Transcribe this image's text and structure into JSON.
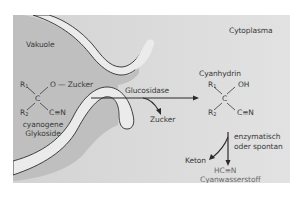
{
  "compartments": {
    "vacuole": "Vakuole",
    "cytoplasm": "Cytoplasma"
  },
  "left_molecule": {
    "r1": "R",
    "r1_sub": "1",
    "r2": "R",
    "r2_sub": "2",
    "center": "C",
    "o_group": "O — Zucker",
    "nitrile": "C≡N",
    "name_line1": "cyanogene",
    "name_line2": "Glykoside"
  },
  "reaction": {
    "enzyme": "Glucosidase",
    "byproduct": "Zucker"
  },
  "right_molecule": {
    "name": "Cyanhydrin",
    "r1": "R",
    "r1_sub": "1",
    "r2": "R",
    "r2_sub": "2",
    "center": "C",
    "oh": "OH",
    "nitrile": "C≡N"
  },
  "decomposition": {
    "condition_line1": "enzymatisch",
    "condition_line2": "oder spontan",
    "byproduct": "Keton",
    "product_formula": "HC≡N",
    "product_name": "Cyanwasserstoff"
  },
  "colors": {
    "vacuole": "#bdbdbd",
    "cytoplasm": "#dcdcdc",
    "membrane": "#e9e9e9",
    "text": "#3a3a3a",
    "product_text": "#6a6a6a"
  }
}
